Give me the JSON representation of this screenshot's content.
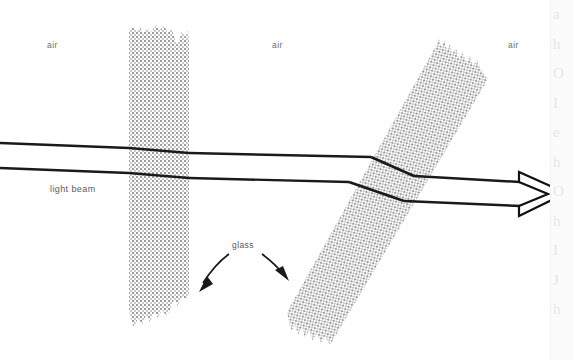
{
  "figure": {
    "background_color": "#ffffff",
    "width": 573,
    "height": 360,
    "labels": {
      "air_left": "air",
      "air_middle": "air",
      "air_right": "air",
      "light_beam": "light beam",
      "glass": "glass"
    },
    "colors": {
      "beam": "#1a1a1a",
      "glass_stipple": "#9a9a9a",
      "label_text": "#5a5a5a",
      "arrow_outline": "#111111"
    },
    "annotations": {
      "glass_pointer_left": "curved-arrow-to-left-slab",
      "glass_pointer_right": "curved-arrow-to-right-slab",
      "beam_direction": "arrowhead-pointing-right"
    },
    "elements": {
      "slab_left": "vertical glass slab with ragged top and bottom edges",
      "slab_right": "tilted glass slab with ragged top and bottom edges",
      "beam_upper": "upper ray of the light beam",
      "beam_lower": "lower ray of the light beam"
    }
  },
  "edge_bleed": {
    "lines": [
      "a",
      "h",
      "O",
      "I",
      "e",
      "h",
      "O",
      "h",
      "I",
      "J",
      "h"
    ]
  }
}
